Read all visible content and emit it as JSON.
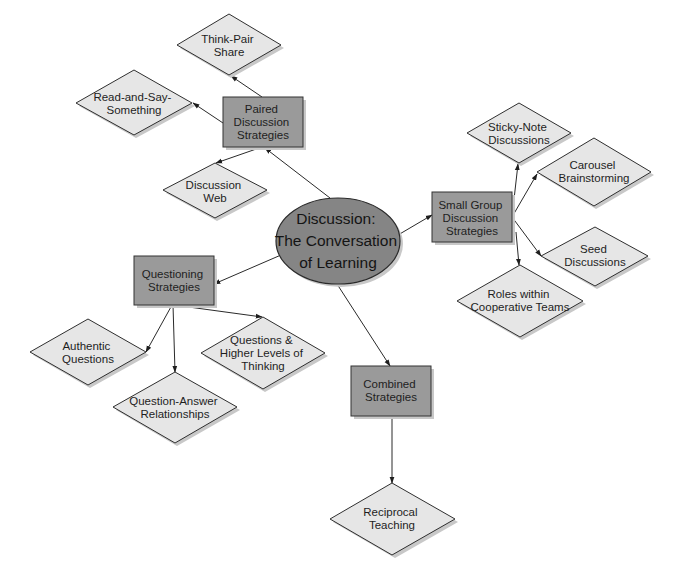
{
  "diagram": {
    "type": "concept-map",
    "colors": {
      "center_fill": "#858585",
      "category_fill": "#9a9a9a",
      "leaf_fill": "#e6e6e6",
      "stroke": "#2f2f2f",
      "background": "#ffffff"
    },
    "center": {
      "lines": [
        "Discussion:",
        "The Conversation",
        "of Learning"
      ]
    },
    "categories": {
      "paired": {
        "lines": [
          "Paired",
          "Discussion",
          "Strategies"
        ]
      },
      "small_group": {
        "lines": [
          "Small Group",
          "Discussion",
          "Strategies"
        ]
      },
      "questioning": {
        "lines": [
          "Questioning",
          "Strategies"
        ]
      },
      "combined": {
        "lines": [
          "Combined",
          "Strategies"
        ]
      }
    },
    "leaves": {
      "think_pair_share": {
        "parent": "paired",
        "lines": [
          "Think-Pair",
          "Share"
        ]
      },
      "read_and_say": {
        "parent": "paired",
        "lines": [
          "Read-and-Say-",
          "Something"
        ]
      },
      "discussion_web": {
        "parent": "paired",
        "lines": [
          "Discussion",
          "Web"
        ]
      },
      "sticky_note": {
        "parent": "small_group",
        "lines": [
          "Sticky-Note",
          "Discussions"
        ]
      },
      "carousel": {
        "parent": "small_group",
        "lines": [
          "Carousel",
          "Brainstorming"
        ]
      },
      "seed": {
        "parent": "small_group",
        "lines": [
          "Seed",
          "Discussions"
        ]
      },
      "roles": {
        "parent": "small_group",
        "lines": [
          "Roles within",
          "Cooperative Teams"
        ]
      },
      "authentic": {
        "parent": "questioning",
        "lines": [
          "Authentic",
          "Questions"
        ]
      },
      "qar": {
        "parent": "questioning",
        "lines": [
          "Question-Answer",
          "Relationships"
        ]
      },
      "higher_levels": {
        "parent": "questioning",
        "lines": [
          "Questions &",
          "Higher Levels of",
          "Thinking"
        ]
      },
      "reciprocal": {
        "parent": "combined",
        "lines": [
          "Reciprocal",
          "Teaching"
        ]
      }
    }
  }
}
